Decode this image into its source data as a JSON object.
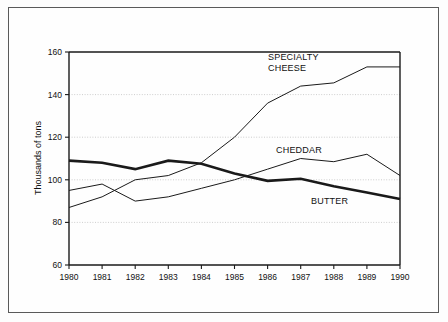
{
  "chart_data": {
    "type": "line",
    "title": "",
    "subtitle": "",
    "xlabel": "",
    "ylabel": "Thousands of tons",
    "x": [
      1980,
      1981,
      1982,
      1983,
      1984,
      1985,
      1986,
      1987,
      1988,
      1989,
      1990
    ],
    "categories": [
      "1980",
      "1981",
      "1982",
      "1983",
      "1984",
      "1985",
      "1986",
      "1987",
      "1988",
      "1989",
      "1990"
    ],
    "xlim": [
      1980,
      1990
    ],
    "ylim": [
      60,
      160
    ],
    "yticks": [
      60,
      80,
      100,
      120,
      140,
      160
    ],
    "ytick_labels": [
      "60",
      "80",
      "100",
      "120",
      "140",
      "160"
    ],
    "grid": "horizontal-dotted",
    "legend": "inline-annotations",
    "series": [
      {
        "name": "SPECIALTY CHEESE",
        "label_lines": [
          "SPECIALTY",
          "CHEESE"
        ],
        "style": "thin",
        "color": "#1a1a1a",
        "values": [
          87,
          92,
          100,
          102,
          108,
          120,
          136,
          144,
          145.5,
          153,
          153
        ]
      },
      {
        "name": "CHEDDAR",
        "label_lines": [
          "CHEDDAR"
        ],
        "style": "thin",
        "color": "#1a1a1a",
        "values": [
          95,
          98,
          90,
          92,
          96,
          100,
          105,
          110,
          108.5,
          112,
          102
        ]
      },
      {
        "name": "BUTTER",
        "label_lines": [
          "BUTTER"
        ],
        "style": "thick",
        "color": "#1a1a1a",
        "values": [
          109,
          108,
          105,
          109,
          107.5,
          103,
          99.5,
          100.5,
          97,
          94,
          91
        ]
      }
    ],
    "annotations": [
      {
        "text": "SPECIALTY",
        "x": 1985.5,
        "y": 152
      },
      {
        "text": "CHEESE",
        "x": 1985.5,
        "y": 147
      },
      {
        "text": "CHEDDAR",
        "x": 1986.1,
        "y": 117
      },
      {
        "text": "BUTTER",
        "x": 1986.7,
        "y": 92
      }
    ]
  },
  "axis": {
    "y_title": "Thousands of tons",
    "y_labels": [
      "160",
      "140",
      "120",
      "100",
      "80",
      "60"
    ],
    "x_labels": [
      "1980",
      "1981",
      "1982",
      "1983",
      "1984",
      "1985",
      "1986",
      "1987",
      "1988",
      "1989",
      "1990"
    ]
  },
  "labels": {
    "specialty_line1": "SPECIALTY",
    "specialty_line2": "CHEESE",
    "cheddar": "CHEDDAR",
    "butter": "BUTTER"
  },
  "colors": {
    "ink": "#1a1a1a",
    "grid": "#b9b9b9",
    "frame": "#5a5a5a",
    "background": "#fefefe"
  }
}
